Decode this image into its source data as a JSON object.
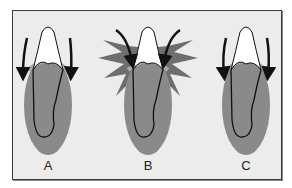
{
  "figure": {
    "panels": [
      {
        "label": "A",
        "variant": "arrows-inward"
      },
      {
        "label": "B",
        "variant": "arrows-with-starburst"
      },
      {
        "label": "C",
        "variant": "arrows-inward"
      }
    ],
    "colors": {
      "background": "#ececec",
      "border": "#3a3a3a",
      "gum": "#8a8a8a",
      "gum_edge": "#a9a9a9",
      "crown": "#ffffff",
      "starburst": "#6e6e6e",
      "outline": "#111111"
    }
  }
}
